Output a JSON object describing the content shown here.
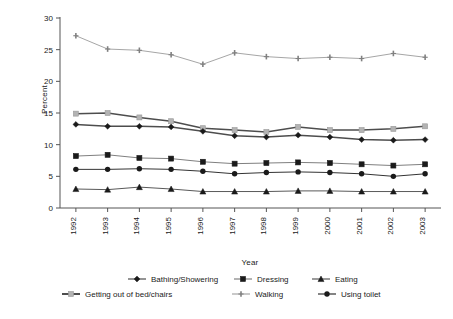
{
  "chart_data": {
    "type": "line",
    "title": "",
    "xlabel": "Year",
    "ylabel": "Percent",
    "x": [
      1992,
      1993,
      1994,
      1995,
      1996,
      1997,
      1998,
      1999,
      2000,
      2001,
      2002,
      2003
    ],
    "categories": [
      "1992",
      "1993",
      "1994",
      "1995",
      "1996",
      "1997",
      "1998",
      "1999",
      "2000",
      "2001",
      "2002",
      "2003"
    ],
    "ylim": [
      0,
      30
    ],
    "yticks": [
      0,
      5,
      10,
      15,
      20,
      25,
      30
    ],
    "ytick_labels": [
      "0",
      "5",
      "10",
      "15",
      "20",
      "25",
      "30"
    ],
    "grid": false,
    "legend_position": "bottom",
    "series": [
      {
        "name": "Bathing/Showering",
        "marker": "diamond",
        "color": "#1a1a1a",
        "line_color": "#4d4d4d",
        "values": [
          13.2,
          12.9,
          12.9,
          12.8,
          12.1,
          11.4,
          11.2,
          11.5,
          11.2,
          10.8,
          10.7,
          10.8
        ]
      },
      {
        "name": "Dressing",
        "marker": "square",
        "color": "#1a1a1a",
        "line_color": "#808080",
        "values": [
          8.2,
          8.4,
          7.9,
          7.8,
          7.3,
          7.0,
          7.1,
          7.2,
          7.1,
          6.9,
          6.7,
          6.9
        ]
      },
      {
        "name": "Eating",
        "marker": "triangle",
        "color": "#1a1a1a",
        "line_color": "#595959",
        "values": [
          3.0,
          2.9,
          3.3,
          3.0,
          2.6,
          2.6,
          2.6,
          2.7,
          2.7,
          2.6,
          2.6,
          2.6
        ]
      },
      {
        "name": "Getting out of bed/chairs",
        "marker": "square-gray",
        "color": "#b3b3b3",
        "line_color": "#4d4d4d",
        "values": [
          14.9,
          15.0,
          14.3,
          13.7,
          12.6,
          12.3,
          12.0,
          12.8,
          12.3,
          12.3,
          12.5,
          12.9
        ]
      },
      {
        "name": "Walking",
        "marker": "cross",
        "color": "#808080",
        "line_color": "#a6a6a6",
        "values": [
          27.2,
          25.1,
          24.9,
          24.2,
          22.7,
          24.5,
          23.9,
          23.6,
          23.8,
          23.6,
          24.4,
          23.8
        ]
      },
      {
        "name": "Using toilet",
        "marker": "circle",
        "color": "#1a1a1a",
        "line_color": "#333333",
        "values": [
          6.1,
          6.1,
          6.2,
          6.1,
          5.8,
          5.4,
          5.6,
          5.7,
          5.6,
          5.4,
          5.0,
          5.4
        ]
      }
    ]
  }
}
